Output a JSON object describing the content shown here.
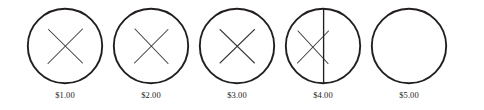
{
  "figure": {
    "type": "coin-tally-diagram",
    "stroke_color": "#231f20",
    "background_color": "#ffffff",
    "circle_count": 5
  },
  "coins": [
    {
      "label": "$1.00",
      "marks": [
        "x-mark"
      ],
      "mark_count": 1,
      "has_x": true,
      "has_vertical_line": false,
      "empty": false
    },
    {
      "label": "$2.00",
      "marks": [
        "x-mark"
      ],
      "mark_count": 1,
      "has_x": true,
      "has_vertical_line": false,
      "empty": false
    },
    {
      "label": "$3.00",
      "marks": [
        "x-mark"
      ],
      "mark_count": 1,
      "has_x": true,
      "has_vertical_line": false,
      "empty": false
    },
    {
      "label": "$4.00",
      "marks": [
        "x-mark",
        "vertical-line-mark"
      ],
      "mark_count": 2,
      "has_x": true,
      "has_vertical_line": true,
      "empty": false
    },
    {
      "label": "$5.00",
      "marks": [],
      "mark_count": 0,
      "has_x": false,
      "has_vertical_line": false,
      "empty": true
    }
  ]
}
